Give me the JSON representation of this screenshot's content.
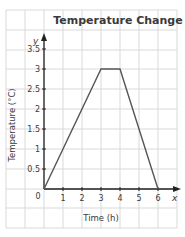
{
  "chart_data": {
    "type": "line",
    "title": "Temperature Change",
    "xlabel": "Time (h)",
    "ylabel": "Temperature (°C)",
    "x_axis_letter": "x",
    "y_axis_letter": "y",
    "origin_label": "0",
    "x_ticks": [
      "1",
      "2",
      "3",
      "4",
      "5",
      "6"
    ],
    "y_ticks": [
      "0.5",
      "1",
      "1.5",
      "2",
      "2.5",
      "3",
      "3.5"
    ],
    "xlim": [
      0,
      7
    ],
    "ylim": [
      0,
      3.75
    ],
    "grid": true,
    "legend": null,
    "series": [
      {
        "name": "Temperature",
        "x": [
          0,
          3,
          4,
          6
        ],
        "y": [
          0,
          3,
          3,
          0
        ]
      }
    ]
  }
}
